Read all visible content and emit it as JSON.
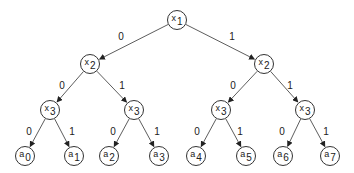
{
  "diagram": {
    "type": "binary-decision-tree",
    "nodes": [
      {
        "id": "n1",
        "var": "x",
        "sub": "1",
        "x": 177,
        "y": 20
      },
      {
        "id": "n2",
        "var": "x",
        "sub": "2",
        "x": 90,
        "y": 64
      },
      {
        "id": "n3",
        "var": "x",
        "sub": "2",
        "x": 264,
        "y": 64
      },
      {
        "id": "n4",
        "var": "x",
        "sub": "3",
        "x": 50,
        "y": 110
      },
      {
        "id": "n5",
        "var": "x",
        "sub": "3",
        "x": 134,
        "y": 110
      },
      {
        "id": "n6",
        "var": "x",
        "sub": "3",
        "x": 221,
        "y": 110
      },
      {
        "id": "n7",
        "var": "x",
        "sub": "3",
        "x": 305,
        "y": 110
      },
      {
        "id": "l0",
        "var": "a",
        "sub": "0",
        "x": 25,
        "y": 156
      },
      {
        "id": "l1",
        "var": "a",
        "sub": "1",
        "x": 74,
        "y": 156
      },
      {
        "id": "l2",
        "var": "a",
        "sub": "2",
        "x": 109,
        "y": 156
      },
      {
        "id": "l3",
        "var": "a",
        "sub": "3",
        "x": 159,
        "y": 156
      },
      {
        "id": "l4",
        "var": "a",
        "sub": "4",
        "x": 196,
        "y": 156
      },
      {
        "id": "l5",
        "var": "a",
        "sub": "5",
        "x": 246,
        "y": 156
      },
      {
        "id": "l6",
        "var": "a",
        "sub": "6",
        "x": 283,
        "y": 156
      },
      {
        "id": "l7",
        "var": "a",
        "sub": "7",
        "x": 330,
        "y": 156
      }
    ],
    "edges": [
      {
        "from": "n1",
        "to": "n2",
        "label": "0",
        "lx": 121,
        "ly": 36
      },
      {
        "from": "n1",
        "to": "n3",
        "label": "1",
        "lx": 232,
        "ly": 36
      },
      {
        "from": "n2",
        "to": "n4",
        "label": "0",
        "lx": 62,
        "ly": 85
      },
      {
        "from": "n2",
        "to": "n5",
        "label": "1",
        "lx": 122,
        "ly": 85
      },
      {
        "from": "n3",
        "to": "n6",
        "label": "0",
        "lx": 233,
        "ly": 85
      },
      {
        "from": "n3",
        "to": "n7",
        "label": "1",
        "lx": 290,
        "ly": 85
      },
      {
        "from": "n4",
        "to": "l0",
        "label": "0",
        "lx": 29,
        "ly": 131
      },
      {
        "from": "n4",
        "to": "l1",
        "label": "1",
        "lx": 72,
        "ly": 131
      },
      {
        "from": "n5",
        "to": "l2",
        "label": "0",
        "lx": 113,
        "ly": 131
      },
      {
        "from": "n5",
        "to": "l3",
        "label": "1",
        "lx": 157,
        "ly": 131
      },
      {
        "from": "n6",
        "to": "l4",
        "label": "0",
        "lx": 197,
        "ly": 131
      },
      {
        "from": "n6",
        "to": "l5",
        "label": "1",
        "lx": 240,
        "ly": 131
      },
      {
        "from": "n7",
        "to": "l6",
        "label": "0",
        "lx": 282,
        "ly": 131
      },
      {
        "from": "n7",
        "to": "l7",
        "label": "1",
        "lx": 326,
        "ly": 131
      }
    ],
    "colors": {
      "stroke": "#333333",
      "text": "#222222",
      "background": "#ffffff"
    }
  }
}
